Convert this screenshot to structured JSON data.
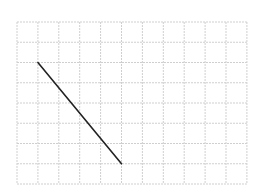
{
  "diagram": {
    "type": "grid-line-segment",
    "grid": {
      "origin_x": 17,
      "origin_y": 22,
      "cell_w": 20.9,
      "cell_h": 20.25,
      "cols": 11,
      "rows": 8,
      "line_color": "#cfcfcf",
      "dash": "2,1"
    },
    "segment": {
      "from": {
        "col": 1,
        "row": 2
      },
      "to": {
        "col": 5,
        "row": 7
      },
      "color": "#222222",
      "width": 1.6
    }
  }
}
